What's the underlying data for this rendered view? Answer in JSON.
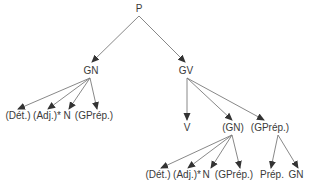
{
  "diagram": {
    "type": "syntax-tree",
    "root": "P",
    "nodes": [
      {
        "id": "p",
        "label": "P",
        "x": 139,
        "y": 9
      },
      {
        "id": "gn",
        "label": "GN",
        "x": 91,
        "y": 71
      },
      {
        "id": "gv",
        "label": "GV",
        "x": 186,
        "y": 71
      },
      {
        "id": "gn-det",
        "label": "(Dét.)",
        "x": 18,
        "y": 116
      },
      {
        "id": "gn-adj",
        "label": "(Adj.)*",
        "x": 47,
        "y": 116
      },
      {
        "id": "gn-n",
        "label": "N",
        "x": 67,
        "y": 116
      },
      {
        "id": "gn-gprep",
        "label": "(GPrép.)",
        "x": 94,
        "y": 116
      },
      {
        "id": "gv-v",
        "label": "V",
        "x": 187,
        "y": 128
      },
      {
        "id": "gv-gn",
        "label": "(GN)",
        "x": 233,
        "y": 128
      },
      {
        "id": "gv-gprep",
        "label": "(GPrép.)",
        "x": 270,
        "y": 128
      },
      {
        "id": "sub-det",
        "label": "(Dét.)",
        "x": 158,
        "y": 175
      },
      {
        "id": "sub-adj",
        "label": "(Adj.)*",
        "x": 187,
        "y": 175
      },
      {
        "id": "sub-n",
        "label": "N",
        "x": 206,
        "y": 175
      },
      {
        "id": "sub-gprep",
        "label": "(GPrép.)",
        "x": 234,
        "y": 175
      },
      {
        "id": "sub-prep",
        "label": "Prép.",
        "x": 272,
        "y": 175
      },
      {
        "id": "sub-gn",
        "label": "GN",
        "x": 296,
        "y": 175
      }
    ],
    "edges": [
      {
        "from": "p",
        "to": "gn",
        "x1": 139,
        "y1": 16,
        "x2": 92,
        "y2": 62
      },
      {
        "from": "p",
        "to": "gv",
        "x1": 139,
        "y1": 16,
        "x2": 185,
        "y2": 62
      },
      {
        "from": "gn",
        "to": "gn-det",
        "x1": 90,
        "y1": 78,
        "x2": 18,
        "y2": 109
      },
      {
        "from": "gn",
        "to": "gn-adj",
        "x1": 90,
        "y1": 78,
        "x2": 48,
        "y2": 109
      },
      {
        "from": "gn",
        "to": "gn-n",
        "x1": 90,
        "y1": 78,
        "x2": 69,
        "y2": 109
      },
      {
        "from": "gn",
        "to": "gn-gprep",
        "x1": 90,
        "y1": 78,
        "x2": 97,
        "y2": 109
      },
      {
        "from": "gv",
        "to": "gv-v",
        "x1": 187,
        "y1": 78,
        "x2": 187,
        "y2": 120
      },
      {
        "from": "gv",
        "to": "gv-gn",
        "x1": 187,
        "y1": 78,
        "x2": 232,
        "y2": 120
      },
      {
        "from": "gv",
        "to": "gv-gprep",
        "x1": 187,
        "y1": 78,
        "x2": 264,
        "y2": 120
      },
      {
        "from": "gv-gn",
        "to": "sub-det",
        "x1": 232,
        "y1": 135,
        "x2": 161,
        "y2": 168
      },
      {
        "from": "gv-gn",
        "to": "sub-adj",
        "x1": 232,
        "y1": 135,
        "x2": 188,
        "y2": 168
      },
      {
        "from": "gv-gn",
        "to": "sub-n",
        "x1": 232,
        "y1": 135,
        "x2": 211,
        "y2": 168
      },
      {
        "from": "gv-gn",
        "to": "sub-gprep",
        "x1": 232,
        "y1": 135,
        "x2": 240,
        "y2": 168
      },
      {
        "from": "gv-gprep",
        "to": "sub-prep",
        "x1": 278,
        "y1": 135,
        "x2": 271,
        "y2": 168
      },
      {
        "from": "gv-gprep",
        "to": "sub-gn",
        "x1": 278,
        "y1": 135,
        "x2": 298,
        "y2": 168
      }
    ],
    "colors": {
      "text": "#3a3a3a",
      "line": "#7a7a7a",
      "arrowhead": "#333333",
      "background": "#ffffff"
    }
  }
}
